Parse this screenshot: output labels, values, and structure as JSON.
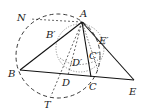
{
  "diagram": {
    "type": "geometry",
    "colors": {
      "stroke": "#222222",
      "background": "#ffffff"
    },
    "points": {
      "A": {
        "label": "A",
        "x": 82,
        "y": 22
      },
      "B": {
        "label": "B",
        "x": 20,
        "y": 70
      },
      "C": {
        "label": "C",
        "x": 91,
        "y": 77
      },
      "D": {
        "label": "D",
        "x": 68,
        "y": 75
      },
      "E": {
        "label": "E",
        "x": 134,
        "y": 80
      },
      "T": {
        "label": "T",
        "x": 51,
        "y": 96
      },
      "N": {
        "label": "N",
        "x": 30,
        "y": 19
      },
      "B_prime": {
        "label": "B'",
        "x": 55,
        "y": 40
      },
      "C_prime": {
        "label": "C'",
        "x": 92,
        "y": 55
      },
      "D_prime": {
        "label": "D'",
        "x": 76,
        "y": 62
      },
      "E_prime": {
        "label": "E'",
        "x": 98,
        "y": 36
      }
    },
    "labels": {
      "A": "A",
      "B": "B",
      "C": "C",
      "D": "D",
      "E": "E",
      "T": "T",
      "N": "N",
      "B_prime": "B′",
      "C_prime": "C′",
      "D_prime": "D′",
      "E_prime": "E′"
    },
    "segments_solid": [
      "AB",
      "AE",
      "BE",
      "AC"
    ],
    "segments_dashed": [
      "AD",
      "AT",
      "AN"
    ],
    "circles": [
      {
        "name": "circumcircle",
        "style": "dashed",
        "cx": 58,
        "cy": 56,
        "r": 42
      },
      {
        "name": "inner-circle",
        "style": "dotted",
        "cx": 80,
        "cy": 48,
        "r": 24
      }
    ]
  }
}
